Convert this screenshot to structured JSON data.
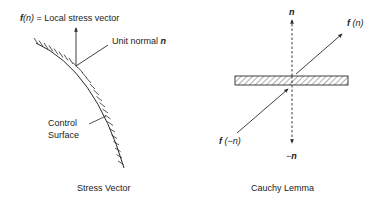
{
  "left_panel": {
    "caption": "Stress Vector",
    "stress_vector_label": {
      "f": "f",
      "arg": "(n)",
      "rest": " = Local stress vector"
    },
    "unit_normal_label": {
      "text": "Unit normal ",
      "symbol": "n"
    },
    "control_surface_label": {
      "line1": "Control",
      "line2": "Surface"
    }
  },
  "right_panel": {
    "caption": "Cauchy Lemma",
    "normal_up_label": "n",
    "normal_down_label": {
      "minus": "−",
      "symbol": "n"
    },
    "f_n_label": {
      "f": "f",
      "arg": " (n)"
    },
    "f_minus_n_label": {
      "f": "f",
      "arg": " (−n)"
    }
  },
  "colors": {
    "line": "#2a2a2a",
    "background": "#ffffff"
  }
}
